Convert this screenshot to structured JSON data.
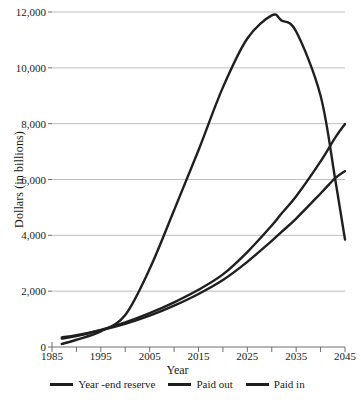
{
  "chart_data": {
    "type": "line",
    "title": "",
    "subtitle": "",
    "xlabel": "Year",
    "ylabel": "Dollars (in billions)",
    "xlim": [
      1985,
      2045
    ],
    "ylim": [
      0,
      12000
    ],
    "xticks": [
      1985,
      1995,
      2005,
      2015,
      2025,
      2035,
      2045
    ],
    "xtick_labels": [
      "1985",
      "1995",
      "2005",
      "2015",
      "2025",
      "2035",
      "2045"
    ],
    "minor_xticks": [
      1990,
      2000,
      2010,
      2020,
      2030,
      2040
    ],
    "yticks": [
      0,
      2000,
      4000,
      6000,
      8000,
      10000,
      12000
    ],
    "ytick_labels": [
      "0",
      "2,000",
      "4,000",
      "6,000",
      "8,000",
      "10,000",
      "12,000"
    ],
    "grid": "horizontal",
    "legend_position": "bottom",
    "line_color": "#1f1f1f",
    "grid_color": "#b7b7b7",
    "axis_color": "#6e6e6e",
    "x": [
      1987,
      1990,
      1995,
      2000,
      2005,
      2010,
      2015,
      2020,
      2025,
      2030,
      2032,
      2035,
      2040,
      2043,
      2045
    ],
    "series": [
      {
        "name": "Year -end reserve",
        "values": [
          110,
          260,
          560,
          1150,
          2800,
          4900,
          7050,
          9300,
          11050,
          11880,
          11700,
          11300,
          9000,
          6000,
          3850
        ]
      },
      {
        "name": "Paid out",
        "values": [
          300,
          390,
          610,
          880,
          1210,
          1600,
          2050,
          2600,
          3400,
          4350,
          4780,
          5400,
          6650,
          7500,
          7990
        ]
      },
      {
        "name": "Paid in",
        "values": [
          345,
          420,
          600,
          830,
          1120,
          1480,
          1900,
          2400,
          3050,
          3800,
          4120,
          4600,
          5500,
          6050,
          6300
        ]
      }
    ]
  },
  "caption": {
    "text": ""
  }
}
